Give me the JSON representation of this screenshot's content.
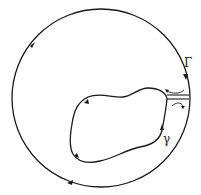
{
  "diagram": {
    "outer_contour_label": "Γ",
    "inner_contour_label": "γ",
    "stroke_color": "#1a1a1a",
    "background": "#ffffff"
  }
}
